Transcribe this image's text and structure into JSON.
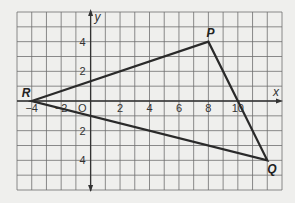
{
  "diagram": {
    "type": "coordinate-plane-triangle",
    "grid": {
      "xmin": -5,
      "xmax": 13,
      "ymin": -6,
      "ymax": 6,
      "step": 1
    },
    "axes": {
      "x_label": "x",
      "y_label": "y",
      "origin_label": "O"
    },
    "x_ticks": [
      {
        "value": -4,
        "label": "−4"
      },
      {
        "value": -2,
        "label": "−2"
      },
      {
        "value": 2,
        "label": "2"
      },
      {
        "value": 4,
        "label": "4"
      },
      {
        "value": 6,
        "label": "6"
      },
      {
        "value": 8,
        "label": "8"
      },
      {
        "value": 10,
        "label": "10"
      }
    ],
    "y_ticks": [
      {
        "value": 4,
        "label": "4"
      },
      {
        "value": 2,
        "label": "2"
      },
      {
        "value": -2,
        "label": "2"
      },
      {
        "value": -4,
        "label": "4"
      }
    ],
    "vertices": [
      {
        "name": "R",
        "x": -4,
        "y": 0
      },
      {
        "name": "P",
        "x": 8,
        "y": 4
      },
      {
        "name": "Q",
        "x": 12,
        "y": -4
      }
    ],
    "colors": {
      "grid": "#6e6e6e",
      "lines": "#2a2a2a",
      "background": "#efefed"
    }
  }
}
